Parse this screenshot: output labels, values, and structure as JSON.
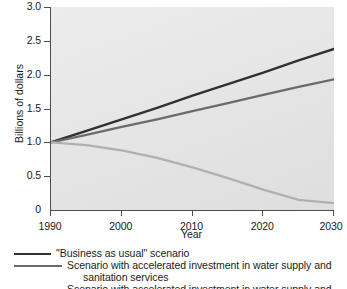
{
  "chart_data": {
    "type": "line",
    "title": "",
    "xlabel": "Year",
    "ylabel": "Billions of dollars",
    "xlim": [
      1990,
      2030
    ],
    "ylim": [
      0,
      3.0
    ],
    "xticks": [
      "1990",
      "2000",
      "2010",
      "2020",
      "2030"
    ],
    "xtick_values": [
      1990,
      2000,
      2010,
      2020,
      2030
    ],
    "yticks": [
      "0",
      "0.5",
      "1.0",
      "1.5",
      "2.0",
      "2.5",
      "3.0"
    ],
    "ytick_values": [
      0,
      0.5,
      1.0,
      1.5,
      2.0,
      2.5,
      3.0
    ],
    "grid": false,
    "legend_position": "below",
    "x": [
      1990,
      1995,
      2000,
      2005,
      2010,
      2015,
      2020,
      2025,
      2030
    ],
    "series": [
      {
        "name": "\"Business as usual\" scenario",
        "color": "#303030",
        "width": 2.3,
        "values": [
          1.0,
          1.17,
          1.34,
          1.51,
          1.69,
          1.86,
          2.03,
          2.21,
          2.38
        ]
      },
      {
        "name": "Scenario with accelerated investment in water supply and sanitation services",
        "color": "#6b6b6b",
        "width": 2.3,
        "values": [
          1.0,
          1.11,
          1.23,
          1.34,
          1.46,
          1.58,
          1.7,
          1.82,
          1.93
        ]
      },
      {
        "name": "Scenario with accelerated investment in water supply and",
        "color": "#b0b0b0",
        "width": 2.3,
        "values": [
          1.0,
          0.96,
          0.88,
          0.77,
          0.63,
          0.47,
          0.3,
          0.15,
          0.1
        ]
      }
    ]
  },
  "legend": {
    "entries": [
      {
        "label": "\"Business as usual\" scenario",
        "color": "#303030",
        "swatch_width": 37
      },
      {
        "label": "Scenario with accelerated investment in water supply and",
        "continuation": "sanitation services",
        "color": "#6b6b6b",
        "swatch_width": 48
      },
      {
        "label": "Scenario with accelerated investment in water supply and",
        "color": "#b0b0b0",
        "swatch_width": 48
      }
    ]
  }
}
